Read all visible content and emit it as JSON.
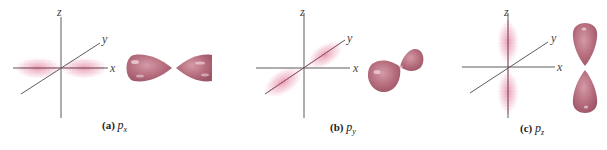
{
  "figure": {
    "colors": {
      "lobe": "#b8707f",
      "lobe_dark": "#9c5567",
      "lobe_highlight": "#e9c5cd",
      "density_dots": "#d9507a",
      "axis": "#4a4a4a"
    },
    "panels": [
      {
        "id": "px",
        "caption_tag": "(a)",
        "caption_symbol": "p",
        "caption_subscript": "x",
        "axes": {
          "x": "x",
          "y": "y",
          "z": "z"
        },
        "orientation": "along x-axis"
      },
      {
        "id": "py",
        "caption_tag": "(b)",
        "caption_symbol": "p",
        "caption_subscript": "y",
        "axes": {
          "x": "x",
          "y": "y",
          "z": "z"
        },
        "orientation": "along y-axis"
      },
      {
        "id": "pz",
        "caption_tag": "(c)",
        "caption_symbol": "p",
        "caption_subscript": "z",
        "axes": {
          "x": "x",
          "y": "y",
          "z": "z"
        },
        "orientation": "along z-axis"
      }
    ]
  }
}
